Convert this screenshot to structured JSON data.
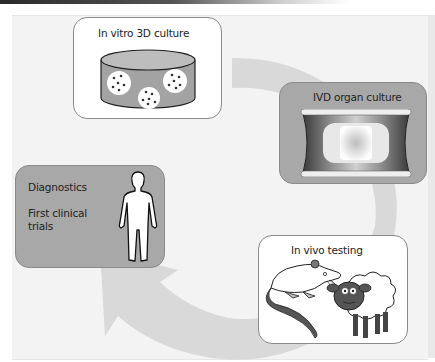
{
  "diagram": {
    "type": "cycle",
    "stages": [
      {
        "id": "in-vitro",
        "label": "In vitro 3D culture",
        "illustration": "culture-dish-with-cell-clusters-icon"
      },
      {
        "id": "organ-culture",
        "label": "IVD organ culture",
        "illustration": "intervertebral-disc-icon"
      },
      {
        "id": "in-vivo",
        "label": "In vivo testing",
        "illustration": "rat-and-sheep-icon"
      },
      {
        "id": "clinical",
        "label_lines": [
          "Diagnostics",
          "First clinical",
          "trials"
        ],
        "illustration": "human-figure-icon"
      }
    ],
    "flow": "clockwise circular arrow from In vitro 3D culture to Diagnostics/First clinical trials",
    "colors": {
      "panel": "#f3f3f3",
      "arrow": "#d9d9d9",
      "gray_box": "#a8a8a8",
      "white_box": "#ffffff",
      "border": "#8a8a8a"
    }
  }
}
